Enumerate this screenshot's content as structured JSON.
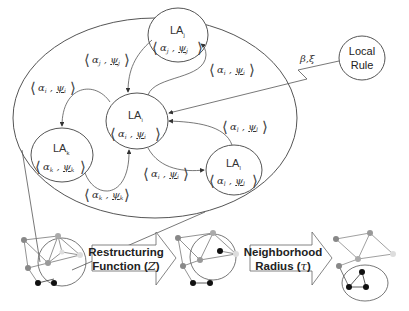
{
  "diagram": {
    "automata": [
      {
        "id": "j",
        "label": "LA",
        "sub": "j",
        "tuple": {
          "alpha": "α",
          "alpha_sub": "j",
          "psi": "ψ",
          "psi_sub": "j"
        }
      },
      {
        "id": "i",
        "label": "LA",
        "sub": "i",
        "tuple": {
          "alpha": "α",
          "alpha_sub": "i",
          "psi": "ψ",
          "psi_sub": "i"
        }
      },
      {
        "id": "k",
        "label": "LA",
        "sub": "k",
        "tuple": {
          "alpha": "α",
          "alpha_sub": "k",
          "psi": "ψ",
          "psi_sub": "k"
        }
      },
      {
        "id": "l",
        "label": "LA",
        "sub": "l",
        "tuple": {
          "alpha": "α",
          "alpha_sub": "l",
          "psi": "ψ",
          "psi_sub": "l"
        }
      }
    ],
    "edge_labels": [
      {
        "from": "j",
        "to": "i",
        "alpha": "α",
        "alpha_sub": "j",
        "psi": "ψ",
        "psi_sub": "j"
      },
      {
        "from": "i",
        "to": "j",
        "alpha": "α",
        "alpha_sub": "i",
        "psi": "ψ",
        "psi_sub": "i"
      },
      {
        "from": "i",
        "to": "k",
        "alpha": "α",
        "alpha_sub": "i",
        "psi": "ψ",
        "psi_sub": "i"
      },
      {
        "from": "k",
        "to": "i",
        "alpha": "α",
        "alpha_sub": "k",
        "psi": "ψ",
        "psi_sub": "k"
      },
      {
        "from": "i",
        "to": "l",
        "alpha": "α",
        "alpha_sub": "i",
        "psi": "ψ",
        "psi_sub": "i"
      },
      {
        "from": "l",
        "to": "i",
        "alpha": "α",
        "alpha_sub": "l",
        "psi": "ψ",
        "psi_sub": "l"
      }
    ],
    "local_rule": {
      "line1": "Local",
      "line2": "Rule",
      "input_label": "β,ξ"
    },
    "arrows": [
      {
        "line1": "Restructuring",
        "line2": "Function (",
        "symbol": "Z",
        "close": ")"
      },
      {
        "line1": "Neighborhood",
        "line2": "Radius (",
        "symbol": "τ",
        "close": ")"
      }
    ],
    "colors": {
      "stroke": "#555555",
      "node_dark": "#111111",
      "node_mid": "#888888",
      "node_light": "#cccccc"
    }
  }
}
